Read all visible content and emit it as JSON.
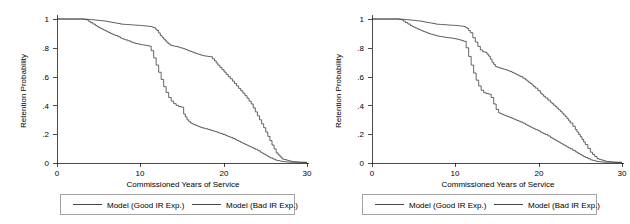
{
  "figure": {
    "width": 630,
    "height": 224,
    "background": "#ffffff",
    "line_color": "#333333",
    "axis_color": "#000000",
    "legend_border_color": "#7a7a7a"
  },
  "chart_data": [
    {
      "id": "left-panel",
      "type": "line",
      "title": "",
      "xlabel": "Commissioned Years of Service",
      "ylabel": "Retention Probability",
      "xlim": [
        0,
        30
      ],
      "ylim": [
        0,
        1
      ],
      "xticks": [
        0,
        10,
        20,
        30
      ],
      "xticklabels": [
        "0",
        "10",
        "20",
        "30"
      ],
      "yticks": [
        0,
        0.2,
        0.4,
        0.6,
        0.8,
        1
      ],
      "yticklabels": [
        "0",
        ".2",
        ".4",
        ".6",
        ".8",
        "1"
      ],
      "grid": false,
      "legend_position": "below",
      "series": [
        {
          "name": "Model (Good IR Exp.)",
          "x": [
            0,
            3.0,
            3.6,
            4.2,
            5.0,
            5.8,
            6.4,
            7.0,
            7.6,
            8.2,
            8.8,
            9.4,
            10.0,
            10.6,
            11.2,
            11.6,
            12.0,
            12.4,
            12.8,
            13.2,
            13.6,
            14.0,
            14.4,
            14.8,
            15.4,
            16.0,
            16.6,
            17.2,
            17.8,
            18.4,
            18.9,
            19.3,
            19.8,
            20.3,
            20.8,
            21.3,
            21.8,
            22.3,
            22.8,
            23.3,
            23.8,
            24.3,
            24.8,
            25.3,
            25.8,
            26.3,
            27.0,
            28.0,
            29.0,
            30.0
          ],
          "y": [
            1.0,
            1.0,
            0.998,
            0.995,
            0.99,
            0.985,
            0.978,
            0.972,
            0.965,
            0.962,
            0.96,
            0.957,
            0.955,
            0.952,
            0.948,
            0.94,
            0.92,
            0.885,
            0.86,
            0.835,
            0.818,
            0.812,
            0.808,
            0.8,
            0.788,
            0.775,
            0.762,
            0.75,
            0.742,
            0.738,
            0.71,
            0.68,
            0.648,
            0.615,
            0.585,
            0.552,
            0.518,
            0.485,
            0.45,
            0.41,
            0.355,
            0.3,
            0.245,
            0.185,
            0.125,
            0.07,
            0.028,
            0.012,
            0.006,
            0.004
          ]
        },
        {
          "name": "Model (Bad IR Exp.)",
          "x": [
            0,
            3.0,
            3.5,
            4.0,
            4.6,
            5.2,
            5.8,
            6.4,
            7.0,
            7.6,
            8.2,
            8.8,
            9.4,
            10.0,
            10.5,
            11.0,
            11.3,
            11.6,
            11.9,
            12.2,
            12.5,
            12.8,
            13.1,
            13.4,
            13.7,
            14.0,
            14.3,
            14.6,
            14.9,
            15.2,
            15.6,
            16.0,
            16.6,
            17.2,
            17.8,
            18.4,
            19.0,
            19.6,
            20.2,
            20.8,
            21.4,
            22.0,
            22.6,
            23.2,
            23.8,
            24.4,
            25.0,
            25.6,
            26.2,
            27.0,
            28.0,
            29.0,
            30.0
          ],
          "y": [
            1.0,
            1.0,
            0.995,
            0.975,
            0.955,
            0.935,
            0.918,
            0.9,
            0.885,
            0.868,
            0.855,
            0.842,
            0.83,
            0.822,
            0.818,
            0.812,
            0.78,
            0.73,
            0.68,
            0.63,
            0.58,
            0.53,
            0.49,
            0.455,
            0.43,
            0.412,
            0.4,
            0.392,
            0.388,
            0.34,
            0.3,
            0.278,
            0.262,
            0.248,
            0.238,
            0.228,
            0.218,
            0.205,
            0.192,
            0.178,
            0.162,
            0.145,
            0.128,
            0.112,
            0.095,
            0.075,
            0.055,
            0.035,
            0.02,
            0.01,
            0.005,
            0.004,
            0.004
          ]
        }
      ]
    },
    {
      "id": "right-panel",
      "type": "line",
      "title": "",
      "xlabel": "Commissioned Years of Service",
      "ylabel": "Retention Probability",
      "xlim": [
        0,
        30
      ],
      "ylim": [
        0,
        1
      ],
      "xticks": [
        0,
        10,
        20,
        30
      ],
      "xticklabels": [
        "0",
        "10",
        "20",
        "30"
      ],
      "yticks": [
        0,
        0.2,
        0.4,
        0.6,
        0.8,
        1
      ],
      "yticklabels": [
        "0",
        ".2",
        ".4",
        ".6",
        ".8",
        "1"
      ],
      "grid": false,
      "legend_position": "below",
      "series": [
        {
          "name": "Model (Good IR Exp.)",
          "x": [
            0,
            3.0,
            3.6,
            4.2,
            5.0,
            5.8,
            6.4,
            7.0,
            7.6,
            8.2,
            8.8,
            9.4,
            10.0,
            10.5,
            11.0,
            11.4,
            11.8,
            12.1,
            12.4,
            12.7,
            13.0,
            13.3,
            13.6,
            14.0,
            14.4,
            14.8,
            15.2,
            15.6,
            16.0,
            16.6,
            17.2,
            17.8,
            18.4,
            19.0,
            19.6,
            20.2,
            20.8,
            21.4,
            22.0,
            22.6,
            23.2,
            23.8,
            24.4,
            25.0,
            25.6,
            26.2,
            27.0,
            28.0,
            29.0,
            30.0
          ],
          "y": [
            1.0,
            1.0,
            0.998,
            0.995,
            0.99,
            0.985,
            0.978,
            0.972,
            0.965,
            0.962,
            0.96,
            0.957,
            0.955,
            0.952,
            0.948,
            0.935,
            0.905,
            0.87,
            0.84,
            0.81,
            0.785,
            0.772,
            0.768,
            0.742,
            0.7,
            0.67,
            0.662,
            0.655,
            0.648,
            0.635,
            0.618,
            0.6,
            0.578,
            0.552,
            0.52,
            0.485,
            0.452,
            0.422,
            0.392,
            0.358,
            0.322,
            0.278,
            0.232,
            0.182,
            0.128,
            0.075,
            0.03,
            0.012,
            0.006,
            0.004
          ]
        },
        {
          "name": "Model (Bad IR Exp.)",
          "x": [
            0,
            3.0,
            3.5,
            4.0,
            4.6,
            5.2,
            5.8,
            6.4,
            7.0,
            7.6,
            8.2,
            8.8,
            9.4,
            10.0,
            10.5,
            11.0,
            11.3,
            11.6,
            11.9,
            12.2,
            12.5,
            12.8,
            13.1,
            13.4,
            13.7,
            14.0,
            14.3,
            14.6,
            14.9,
            15.2,
            15.6,
            16.0,
            16.6,
            17.2,
            17.8,
            18.4,
            19.0,
            19.6,
            20.2,
            20.8,
            21.4,
            22.0,
            22.6,
            23.2,
            23.8,
            24.4,
            25.0,
            25.6,
            26.2,
            27.0,
            28.0,
            29.0,
            30.0
          ],
          "y": [
            1.0,
            1.0,
            0.995,
            0.975,
            0.955,
            0.938,
            0.922,
            0.908,
            0.895,
            0.885,
            0.878,
            0.872,
            0.868,
            0.862,
            0.855,
            0.845,
            0.8,
            0.74,
            0.68,
            0.625,
            0.575,
            0.535,
            0.505,
            0.488,
            0.482,
            0.478,
            0.455,
            0.41,
            0.372,
            0.348,
            0.338,
            0.328,
            0.315,
            0.3,
            0.285,
            0.268,
            0.25,
            0.232,
            0.215,
            0.198,
            0.178,
            0.158,
            0.138,
            0.118,
            0.098,
            0.078,
            0.058,
            0.038,
            0.022,
            0.01,
            0.005,
            0.004,
            0.004
          ]
        }
      ]
    }
  ],
  "panels": {
    "left": {
      "name": "left-panel",
      "ylabel": "Retention Probability",
      "xlabel": "Commissioned Years of Service",
      "yticklabels": [
        "1",
        ".8",
        ".6",
        ".4",
        ".2",
        "0"
      ],
      "xticklabels": [
        "0",
        "10",
        "20",
        "30"
      ],
      "legend": {
        "items": [
          {
            "label": "Model (Good IR Exp.)"
          },
          {
            "label": "Model (Bad IR Exp.)"
          }
        ]
      }
    },
    "right": {
      "name": "right-panel",
      "ylabel": "Retention Probability",
      "xlabel": "Commissioned Years of Service",
      "yticklabels": [
        "1",
        ".8",
        ".6",
        ".4",
        ".2",
        "0"
      ],
      "xticklabels": [
        "0",
        "10",
        "20",
        "30"
      ],
      "legend": {
        "items": [
          {
            "label": "Model (Good IR Exp.)"
          },
          {
            "label": "Model (Bad IR Exp.)"
          }
        ]
      }
    }
  }
}
